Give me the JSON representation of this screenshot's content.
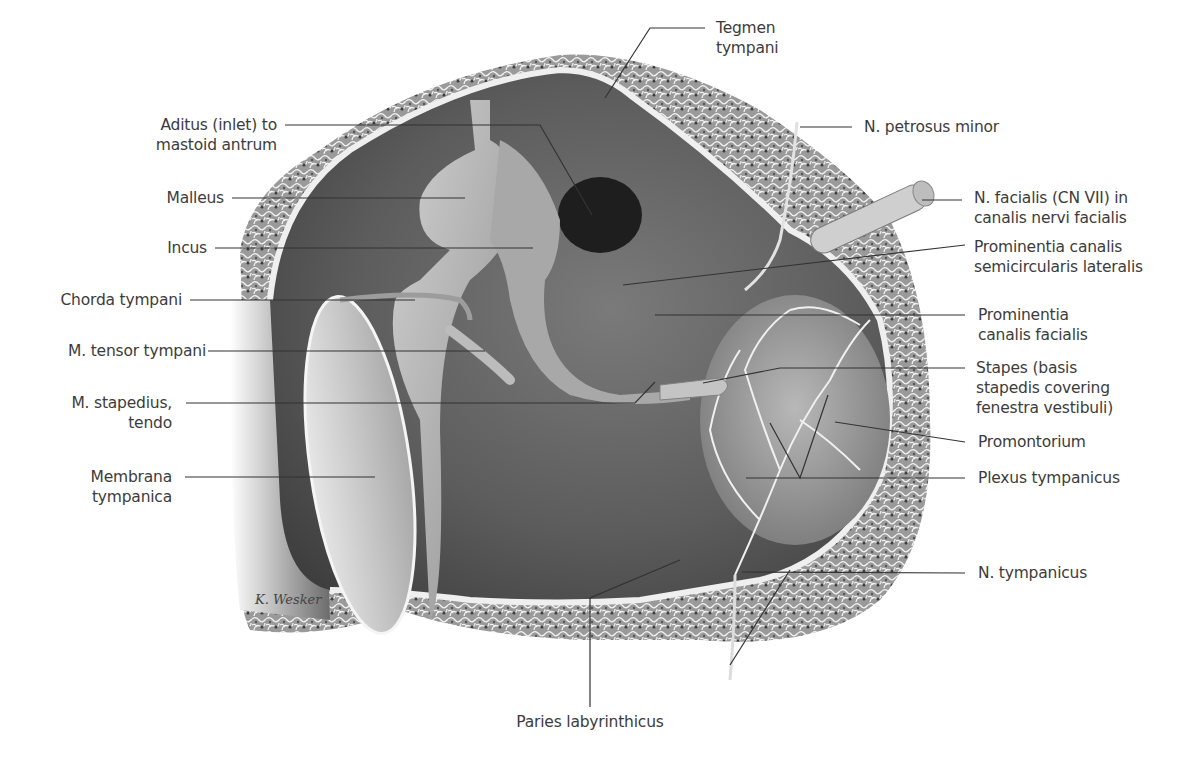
{
  "figure": {
    "signature": "K. Wesker",
    "colors": {
      "background": "#ffffff",
      "bone_spongy": "#8a8a8a",
      "bone_cortex": "#e8e8e8",
      "cavity_dark": "#5a5a5a",
      "ossicle": "#b4b4b4",
      "label_text": "#3c3c3c",
      "leader_line": "#333333"
    }
  },
  "labels": {
    "left": [
      {
        "id": "aditus",
        "lines": [
          "Aditus (inlet) to",
          "mastoid antrum"
        ]
      },
      {
        "id": "malleus",
        "lines": [
          "Malleus"
        ]
      },
      {
        "id": "incus",
        "lines": [
          "Incus"
        ]
      },
      {
        "id": "chorda_tympani",
        "lines": [
          "Chorda tympani"
        ]
      },
      {
        "id": "m_tensor_tympani",
        "lines": [
          "M. tensor tympani"
        ]
      },
      {
        "id": "m_stapedius",
        "lines": [
          "M. stapedius,",
          "tendo"
        ]
      },
      {
        "id": "membrana_tympanica",
        "lines": [
          "Membrana",
          "tympanica"
        ]
      }
    ],
    "top": [
      {
        "id": "tegmen_tympani",
        "lines": [
          "Tegmen",
          "tympani"
        ]
      }
    ],
    "right": [
      {
        "id": "n_petrosus_minor",
        "lines": [
          "N. petrosus minor"
        ]
      },
      {
        "id": "n_facialis",
        "lines": [
          "N. facialis (CN VII) in",
          "canalis nervi facialis"
        ]
      },
      {
        "id": "prom_canalis_semicircularis",
        "lines": [
          "Prominentia canalis",
          "semicircularis lateralis"
        ]
      },
      {
        "id": "prom_canalis_facialis",
        "lines": [
          "Prominentia",
          "canalis facialis"
        ]
      },
      {
        "id": "stapes",
        "lines": [
          "Stapes (basis",
          "stapedis covering",
          "fenestra vestibuli)"
        ]
      },
      {
        "id": "promontorium",
        "lines": [
          "Promontorium"
        ]
      },
      {
        "id": "plexus_tympanicus",
        "lines": [
          "Plexus tympanicus"
        ]
      },
      {
        "id": "n_tympanicus",
        "lines": [
          "N. tympanicus"
        ]
      }
    ],
    "bottom": [
      {
        "id": "paries_labyrinthicus",
        "lines": [
          "Paries labyrinthicus"
        ]
      }
    ]
  }
}
